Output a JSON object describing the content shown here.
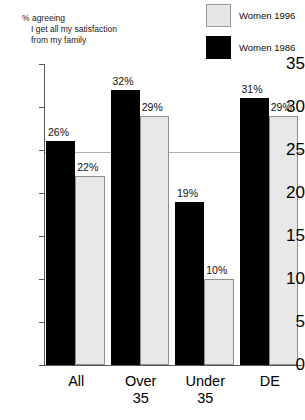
{
  "chart_data": {
    "type": "bar",
    "title": "% agreeing I get all my satisfaction from my family",
    "title_lines": [
      "% agreeing",
      "I get all my satisfaction",
      "from my family"
    ],
    "xlabel": "",
    "ylabel": "",
    "ylim": [
      0,
      35
    ],
    "ytick_step": 5,
    "yticks": [
      "0",
      "5",
      "10",
      "15",
      "20",
      "25",
      "30",
      "35"
    ],
    "ytick_values": [
      0,
      5,
      10,
      15,
      20,
      25,
      30,
      35
    ],
    "grid": false,
    "legend_position": "top-right",
    "categories": [
      "All",
      "Over 35",
      "Under 35",
      "DE"
    ],
    "category_lines": [
      [
        "All",
        ""
      ],
      [
        "Over",
        "35"
      ],
      [
        "Under",
        "35"
      ],
      [
        "DE",
        ""
      ]
    ],
    "series": [
      {
        "name": "Women 1986",
        "color": "#000000",
        "values": [
          26,
          32,
          19,
          31
        ],
        "labels": [
          "26%",
          "32%",
          "19%",
          "31%"
        ]
      },
      {
        "name": "Women 1996",
        "color": "#e8e8e8",
        "values": [
          22,
          29,
          10,
          29
        ],
        "labels": [
          "22%",
          "29%",
          "10%",
          "29%"
        ]
      }
    ]
  },
  "legend": {
    "items": [
      {
        "label": "Women 1996",
        "swatch": "light"
      },
      {
        "label": "Women 1986",
        "swatch": "dark"
      }
    ]
  }
}
